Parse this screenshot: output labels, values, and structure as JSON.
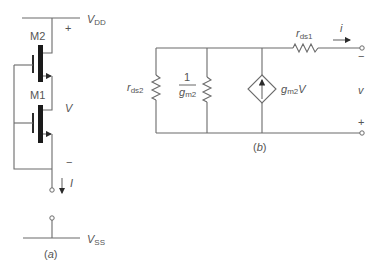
{
  "figure": {
    "panel_a": {
      "caption": "(a)",
      "vdd": {
        "main": "V",
        "sub": "DD"
      },
      "vss": {
        "main": "V",
        "sub": "SS"
      },
      "transistor_top": "M2",
      "transistor_bottom": "M1",
      "plus": "+",
      "minus": "−",
      "voltage_label": "V",
      "current_label": "I"
    },
    "panel_b": {
      "caption": "(b)",
      "rds2": {
        "main": "r",
        "sub": "ds2"
      },
      "inv_gm2": {
        "num": "1",
        "den_main": "g",
        "den_sub": "m2"
      },
      "source": {
        "main": "g",
        "sub": "m2",
        "suffix": "V"
      },
      "rds1": {
        "main": "r",
        "sub": "ds1"
      },
      "current_label": "i",
      "minus": "−",
      "voltage_label": "v",
      "plus": "+"
    }
  }
}
